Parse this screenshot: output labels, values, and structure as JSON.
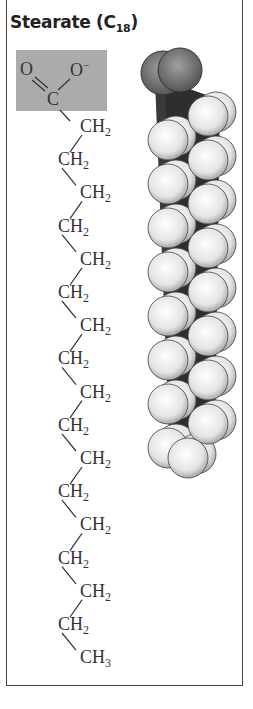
{
  "figure": {
    "title_main": "Stearate (C",
    "title_sub": "18",
    "title_close": ")"
  },
  "carboxyl_group": {
    "oxygen_double": "O",
    "oxygen_single": "O",
    "charge": "−",
    "carbon": "C",
    "highlight_color": "#ababab"
  },
  "chain": {
    "units": [
      {
        "label": "CH",
        "sub": "2",
        "side": "right"
      },
      {
        "label": "CH",
        "sub": "2",
        "side": "left"
      },
      {
        "label": "CH",
        "sub": "2",
        "side": "right"
      },
      {
        "label": "CH",
        "sub": "2",
        "side": "left"
      },
      {
        "label": "CH",
        "sub": "2",
        "side": "right"
      },
      {
        "label": "CH",
        "sub": "2",
        "side": "left"
      },
      {
        "label": "CH",
        "sub": "2",
        "side": "right"
      },
      {
        "label": "CH",
        "sub": "2",
        "side": "left"
      },
      {
        "label": "CH",
        "sub": "2",
        "side": "right"
      },
      {
        "label": "CH",
        "sub": "2",
        "side": "left"
      },
      {
        "label": "CH",
        "sub": "2",
        "side": "right"
      },
      {
        "label": "CH",
        "sub": "2",
        "side": "left"
      },
      {
        "label": "CH",
        "sub": "2",
        "side": "right"
      },
      {
        "label": "CH",
        "sub": "2",
        "side": "left"
      },
      {
        "label": "CH",
        "sub": "2",
        "side": "right"
      },
      {
        "label": "CH",
        "sub": "2",
        "side": "left"
      },
      {
        "label": "CH",
        "sub": "3",
        "side": "right"
      }
    ]
  },
  "space_filling_model": {
    "oxygen_color": "#6e6e6e",
    "hydrogen_color": "#f2f2f2",
    "carbon_color": "#3a3a3a"
  }
}
